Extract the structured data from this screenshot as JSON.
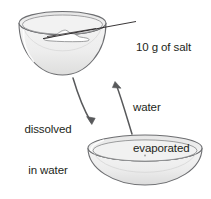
{
  "diagram": {
    "labels": {
      "salt_amount": "10 g of salt",
      "dissolved_line1": "dissolved",
      "dissolved_line2": "in water",
      "evaporated_line1": "water",
      "evaporated_line2": "evaporated"
    },
    "objects": {
      "top_bowl": "deep round bowl containing a white pile of salt",
      "bottom_bowl": "shallow wide dish, empty",
      "salt_pile": "white mound of salt",
      "leader_line": "pointer line from salt pile to the 10 g of salt label",
      "arrow_down": "curved arrow from top bowl down to bottom dish",
      "arrow_up": "curved arrow from bottom dish up to top bowl"
    },
    "colors": {
      "outline": "#6d6e71",
      "glass_fill": "#efefef",
      "glass_fill_dark": "#e2e2e2",
      "salt_fill": "#ffffff",
      "text": "#231f20",
      "arrow": "#58595b"
    }
  }
}
